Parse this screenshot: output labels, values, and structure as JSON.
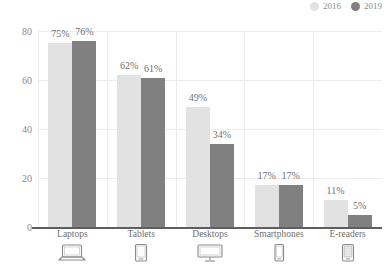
{
  "chart_data": {
    "type": "bar",
    "title": "",
    "subtitle": "",
    "xlabel": "",
    "ylabel": "",
    "categories": [
      "Laptops",
      "Tablets",
      "Desktops",
      "Smartphones",
      "E-readers"
    ],
    "series": [
      {
        "name": "2016",
        "color": "#e2e2e2",
        "values": [
          75,
          62,
          49,
          17,
          11
        ],
        "labels": [
          "75%",
          "62%",
          "49%",
          "17%",
          "11%"
        ]
      },
      {
        "name": "2019",
        "color": "#808080",
        "values": [
          76,
          61,
          34,
          17,
          5
        ],
        "labels": [
          "76%",
          "61%",
          "34%",
          "17%",
          "5%"
        ]
      }
    ],
    "ylim": [
      0,
      80
    ],
    "yticks": [
      0,
      20,
      40,
      60,
      80
    ],
    "ytick_labels": [
      "0",
      "20",
      "40",
      "60",
      "80"
    ],
    "grid": true,
    "legend_position": "top-right",
    "category_icons": [
      "laptop-icon",
      "tablet-icon",
      "desktop-icon",
      "smartphone-icon",
      "ereader-icon"
    ]
  },
  "legend": {
    "items": [
      {
        "label": "2016",
        "color": "#e2e2e2"
      },
      {
        "label": "2019",
        "color": "#808080"
      }
    ]
  },
  "colors": {
    "series_2016": "#e2e2e2",
    "series_2019": "#808080",
    "gridline": "#ececec",
    "axis": "#5e5e5e",
    "text": "#6f6f6f",
    "tick_text": "#8a8a8a"
  }
}
